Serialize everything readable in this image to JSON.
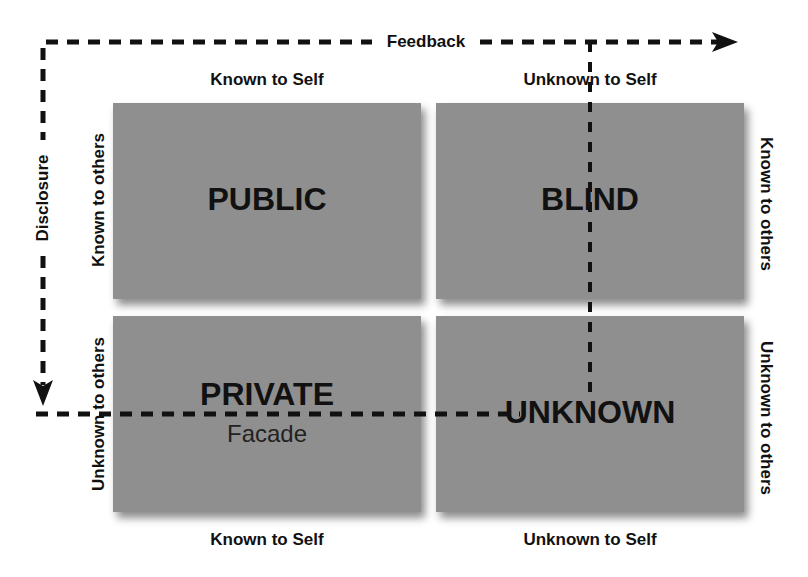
{
  "diagram": {
    "type": "johari-window",
    "quadrants": [
      {
        "id": "public",
        "title": "PUBLIC",
        "subtitle": ""
      },
      {
        "id": "blind",
        "title": "BLIND",
        "subtitle": ""
      },
      {
        "id": "private",
        "title": "PRIVATE",
        "subtitle": "Facade"
      },
      {
        "id": "unknown",
        "title": "UNKNOWN",
        "subtitle": ""
      }
    ],
    "top_labels": [
      "Known to Self",
      "Unknown to Self"
    ],
    "bottom_labels": [
      "Known to Self",
      "Unknown to Self"
    ],
    "left_labels": [
      "Known to others",
      "Unknown to others"
    ],
    "right_labels": [
      "Known to others",
      "Unknown to others"
    ],
    "arrows": {
      "feedback": "Feedback",
      "disclosure": "Disclosure"
    },
    "colors": {
      "quadrant": "#8f8f8f",
      "text": "#111111",
      "background": "#ffffff"
    }
  }
}
